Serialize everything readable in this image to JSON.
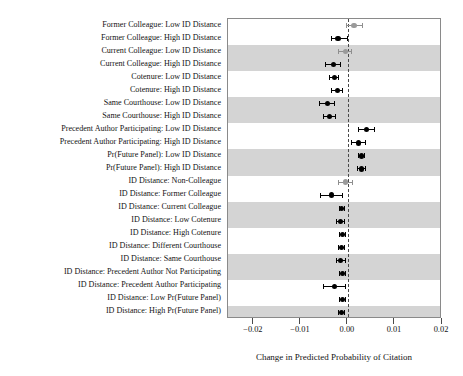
{
  "chart_data": {
    "type": "scatter",
    "title": "",
    "subtitle": "",
    "xlabel": "Change in Predicted Probability of Citation",
    "ylabel": "",
    "xlim": [
      -0.0255,
      0.02
    ],
    "xticks": [
      -0.02,
      -0.01,
      0.0,
      0.01,
      0.02
    ],
    "xticklabels": [
      "−0.02",
      "−0.01",
      "0.00",
      "0.01",
      "0.02"
    ],
    "grid": false,
    "legend_position": "none",
    "zero_reference_line": 0.0,
    "zero_line_style": "dashed",
    "orientation": "horizontal-dotplot",
    "categories": [
      "Former Colleague: Low ID Distance",
      "Former Colleague: High ID Distance",
      "Current Colleague: Low ID Distance",
      "Current Colleague: High ID Distance",
      "Cotenure: Low ID Distance",
      "Cotenure: High ID Distance",
      "Same Courthouse: Low ID Distance",
      "Same Courthouse: High ID Distance",
      "Precedent Author Participating: Low ID Distance",
      "Precedent Author Participating: High ID Distance",
      "Pr(Future Panel): Low ID Distance",
      "Pr(Future Panel): High ID Distance",
      "ID Distance: Non-Colleague",
      "ID Distance: Former Colleague",
      "ID Distance: Current Colleague",
      "ID Distance: Low Cotenure",
      "ID Distance: High Cotenure",
      "ID Distance: Different Courthouse",
      "ID Distance: Same Courthouse",
      "ID Distance: Precedent Author Not Participating",
      "ID Distance: Precedent Author Participating",
      "ID Distance: Low Pr(Future Panel)",
      "ID Distance: High Pr(Future Panel)"
    ],
    "points": [
      {
        "label": "Former Colleague: Low ID Distance",
        "estimate": 0.0013,
        "ci_low": -0.0004,
        "ci_high": 0.0031,
        "significant": false
      },
      {
        "label": "Former Colleague: High ID Distance",
        "estimate": -0.0021,
        "ci_low": -0.0037,
        "ci_high": 0.0,
        "significant": true
      },
      {
        "label": "Current Colleague: Low ID Distance",
        "estimate": -0.0006,
        "ci_low": -0.0021,
        "ci_high": 0.0008,
        "significant": false
      },
      {
        "label": "Current Colleague: High ID Distance",
        "estimate": -0.0031,
        "ci_low": -0.0049,
        "ci_high": -0.0014,
        "significant": true
      },
      {
        "label": "Cotenure: Low ID Distance",
        "estimate": -0.0029,
        "ci_low": -0.004,
        "ci_high": -0.0018,
        "significant": true
      },
      {
        "label": "Cotenure: High ID Distance",
        "estimate": -0.0023,
        "ci_low": -0.0035,
        "ci_high": -0.0011,
        "significant": true
      },
      {
        "label": "Same Courthouse: Low ID Distance",
        "estimate": -0.0044,
        "ci_low": -0.0061,
        "ci_high": -0.0027,
        "significant": true
      },
      {
        "label": "Same Courthouse: High ID Distance",
        "estimate": -0.004,
        "ci_low": -0.0054,
        "ci_high": -0.0025,
        "significant": true
      },
      {
        "label": "Precedent Author Participating: Low ID Distance",
        "estimate": 0.0039,
        "ci_low": 0.0021,
        "ci_high": 0.0057,
        "significant": true
      },
      {
        "label": "Precedent Author Participating: High ID Distance",
        "estimate": 0.0022,
        "ci_low": 0.0007,
        "ci_high": 0.0038,
        "significant": true
      },
      {
        "label": "Pr(Future Panel): Low ID Distance",
        "estimate": 0.0029,
        "ci_low": 0.0022,
        "ci_high": 0.0036,
        "significant": true
      },
      {
        "label": "Pr(Future Panel): High ID Distance",
        "estimate": 0.0029,
        "ci_low": 0.002,
        "ci_high": 0.0038,
        "significant": true
      },
      {
        "label": "ID Distance: Non-Colleague",
        "estimate": -0.0006,
        "ci_low": -0.0021,
        "ci_high": 0.001,
        "significant": false
      },
      {
        "label": "ID Distance: Former Colleague",
        "estimate": -0.0035,
        "ci_low": -0.006,
        "ci_high": -0.0011,
        "significant": true
      },
      {
        "label": "ID Distance: Current Colleague",
        "estimate": -0.0013,
        "ci_low": -0.002,
        "ci_high": -0.0007,
        "significant": true
      },
      {
        "label": "ID Distance: Low Cotenure",
        "estimate": -0.0016,
        "ci_low": -0.0026,
        "ci_high": -0.0006,
        "significant": true
      },
      {
        "label": "ID Distance: High Cotenure",
        "estimate": -0.0012,
        "ci_low": -0.0019,
        "ci_high": -0.0005,
        "significant": true
      },
      {
        "label": "ID Distance: Different Courthouse",
        "estimate": -0.0014,
        "ci_low": -0.0022,
        "ci_high": -0.0006,
        "significant": true
      },
      {
        "label": "ID Distance: Same Courthouse",
        "estimate": -0.0015,
        "ci_low": -0.0026,
        "ci_high": -0.0005,
        "significant": true
      },
      {
        "label": "ID Distance: Precedent Author Not Participating",
        "estimate": -0.0011,
        "ci_low": -0.0019,
        "ci_high": -0.0004,
        "significant": true
      },
      {
        "label": "ID Distance: Precedent Author Participating",
        "estimate": -0.0028,
        "ci_low": -0.0052,
        "ci_high": -0.0005,
        "significant": true
      },
      {
        "label": "ID Distance: Low Pr(Future Panel)",
        "estimate": -0.0012,
        "ci_low": -0.002,
        "ci_high": -0.0005,
        "significant": true
      },
      {
        "label": "ID Distance: High Pr(Future Panel)",
        "estimate": -0.0013,
        "ci_low": -0.0021,
        "ci_high": -0.0006,
        "significant": true
      }
    ],
    "colors": {
      "significant_marker": "#000000",
      "nonsignificant_marker": "#9a9a9a",
      "band": "#d4d4d4",
      "panel_background": "#ffffff",
      "panel_border": "#8a8a8a",
      "zero_line": "#4a4a4a"
    },
    "band_groups": [
      {
        "rows": [
          1,
          2
        ],
        "shaded": false
      },
      {
        "rows": [
          3,
          4
        ],
        "shaded": true
      },
      {
        "rows": [
          5,
          6
        ],
        "shaded": false
      },
      {
        "rows": [
          7,
          8
        ],
        "shaded": true
      },
      {
        "rows": [
          9,
          10
        ],
        "shaded": false
      },
      {
        "rows": [
          11,
          12
        ],
        "shaded": true
      },
      {
        "rows": [
          13,
          14
        ],
        "shaded": false
      },
      {
        "rows": [
          15,
          16
        ],
        "shaded": true
      },
      {
        "rows": [
          17,
          18
        ],
        "shaded": false
      },
      {
        "rows": [
          19,
          20
        ],
        "shaded": true
      },
      {
        "rows": [
          21,
          22
        ],
        "shaded": false
      },
      {
        "rows": [
          23
        ],
        "shaded": true
      }
    ]
  }
}
